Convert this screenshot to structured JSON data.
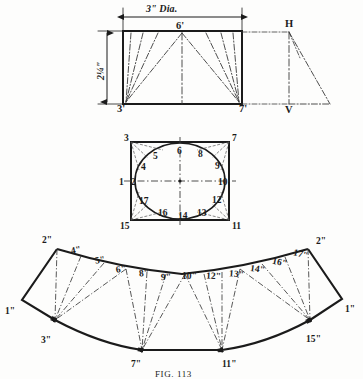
{
  "figure": {
    "caption": "FIG. 113"
  },
  "elevation": {
    "name": "elevation-view",
    "dim_horizontal": "3\"  Dia.",
    "dim_vertical": "2¼\"",
    "apex_label": "6'",
    "corner_left": "3'",
    "corner_right": "7'",
    "aux_top": "H",
    "aux_bottom": "V"
  },
  "plan": {
    "name": "plan-view",
    "points": [
      {
        "id": "p1",
        "text": "1",
        "x": 119,
        "y": 178
      },
      {
        "id": "p2",
        "text": "2",
        "x": 131,
        "y": 178
      },
      {
        "id": "p3",
        "text": "3",
        "x": 124,
        "y": 134
      },
      {
        "id": "p4",
        "text": "4",
        "x": 141,
        "y": 163
      },
      {
        "id": "p5",
        "text": "5",
        "x": 153,
        "y": 152
      },
      {
        "id": "p6",
        "text": "6",
        "x": 177,
        "y": 147
      },
      {
        "id": "p7",
        "text": "7",
        "x": 232,
        "y": 134
      },
      {
        "id": "p8",
        "text": "8",
        "x": 198,
        "y": 150
      },
      {
        "id": "p9",
        "text": "9",
        "x": 215,
        "y": 162
      },
      {
        "id": "p10",
        "text": "10",
        "x": 218,
        "y": 178
      },
      {
        "id": "p11",
        "text": "11",
        "x": 232,
        "y": 222
      },
      {
        "id": "p12",
        "text": "12",
        "x": 212,
        "y": 196
      },
      {
        "id": "p13",
        "text": "13",
        "x": 197,
        "y": 209
      },
      {
        "id": "p14",
        "text": "14",
        "x": 178,
        "y": 212
      },
      {
        "id": "p15",
        "text": "15",
        "x": 120,
        "y": 222
      },
      {
        "id": "p16",
        "text": "16",
        "x": 158,
        "y": 209
      },
      {
        "id": "p17",
        "text": "17",
        "x": 139,
        "y": 197
      }
    ]
  },
  "development": {
    "name": "development-pattern",
    "points": [
      {
        "id": "d1l",
        "text": "1\"",
        "x": 5,
        "y": 307,
        "rot": 0
      },
      {
        "id": "d2l",
        "text": "2\"",
        "x": 42,
        "y": 236,
        "rot": 0
      },
      {
        "id": "d3l",
        "text": "3\"",
        "x": 41,
        "y": 336,
        "rot": 0
      },
      {
        "id": "d4",
        "text": "4\"",
        "x": 71,
        "y": 246,
        "rot": -12
      },
      {
        "id": "d5",
        "text": "5\"",
        "x": 95,
        "y": 256,
        "rot": -10
      },
      {
        "id": "d6",
        "text": "6\"",
        "x": 116,
        "y": 265,
        "rot": -8
      },
      {
        "id": "d7",
        "text": "7\"",
        "x": 131,
        "y": 360,
        "rot": 0
      },
      {
        "id": "d8",
        "text": "8\"",
        "x": 139,
        "y": 269,
        "rot": -5
      },
      {
        "id": "d9",
        "text": "9\"",
        "x": 161,
        "y": 273,
        "rot": -3
      },
      {
        "id": "d10",
        "text": "10\"",
        "x": 182,
        "y": 272,
        "rot": 0
      },
      {
        "id": "d11",
        "text": "11\"",
        "x": 222,
        "y": 360,
        "rot": 0
      },
      {
        "id": "d12",
        "text": "12\"",
        "x": 206,
        "y": 272,
        "rot": 3
      },
      {
        "id": "d13",
        "text": "13\"",
        "x": 229,
        "y": 270,
        "rot": 5
      },
      {
        "id": "d14",
        "text": "14\"",
        "x": 250,
        "y": 265,
        "rot": 8
      },
      {
        "id": "d16",
        "text": "16\"",
        "x": 272,
        "y": 258,
        "rot": 12
      },
      {
        "id": "d17",
        "text": "17\"",
        "x": 293,
        "y": 250,
        "rot": 14
      },
      {
        "id": "d2r",
        "text": "2\"",
        "x": 316,
        "y": 237,
        "rot": 0
      },
      {
        "id": "d15r",
        "text": "15\"",
        "x": 306,
        "y": 335,
        "rot": 0
      },
      {
        "id": "d1r",
        "text": "1\"",
        "x": 345,
        "y": 305,
        "rot": 0
      }
    ]
  },
  "colors": {
    "ink": "#1b1b1b",
    "line": "#2a2a2a",
    "chain": "#444444",
    "paper": "#fdfdfc"
  }
}
